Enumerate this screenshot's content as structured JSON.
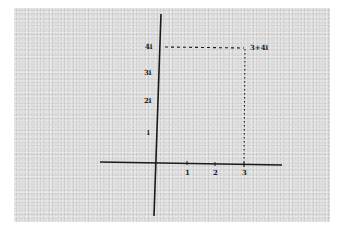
{
  "diagram": {
    "type": "argand-plane",
    "colors": {
      "background": "#d9d9d9",
      "ink": "#1a1a1a",
      "page": "#ffffff"
    },
    "y_axis_labels": [
      {
        "text": "4i",
        "value": 4
      },
      {
        "text": "3i",
        "value": 3
      },
      {
        "text": "2i",
        "value": 2
      },
      {
        "text": "i",
        "value": 1
      }
    ],
    "x_axis_labels": [
      {
        "text": "1",
        "value": 1
      },
      {
        "text": "2",
        "value": 2
      },
      {
        "text": "3",
        "value": 3
      }
    ],
    "point": {
      "label": "3+4i",
      "re": 3,
      "im": 4
    }
  }
}
